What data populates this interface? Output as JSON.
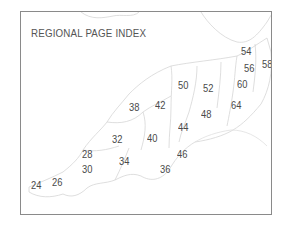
{
  "map": {
    "title": "REGIONAL PAGE INDEX",
    "pages": [
      {
        "label": "24",
        "x": 10,
        "y": 168
      },
      {
        "label": "26",
        "x": 31,
        "y": 165
      },
      {
        "label": "28",
        "x": 61,
        "y": 137
      },
      {
        "label": "30",
        "x": 61,
        "y": 152
      },
      {
        "label": "32",
        "x": 91,
        "y": 122
      },
      {
        "label": "34",
        "x": 98,
        "y": 144
      },
      {
        "label": "36",
        "x": 139,
        "y": 152
      },
      {
        "label": "38",
        "x": 108,
        "y": 90
      },
      {
        "label": "40",
        "x": 126,
        "y": 121
      },
      {
        "label": "42",
        "x": 134,
        "y": 88
      },
      {
        "label": "44",
        "x": 157,
        "y": 110
      },
      {
        "label": "46",
        "x": 156,
        "y": 137
      },
      {
        "label": "48",
        "x": 180,
        "y": 97
      },
      {
        "label": "50",
        "x": 157,
        "y": 68
      },
      {
        "label": "52",
        "x": 182,
        "y": 71
      },
      {
        "label": "54",
        "x": 220,
        "y": 34
      },
      {
        "label": "56",
        "x": 223,
        "y": 51
      },
      {
        "label": "58",
        "x": 241,
        "y": 47
      },
      {
        "label": "60",
        "x": 216,
        "y": 67
      },
      {
        "label": "64",
        "x": 210,
        "y": 88
      }
    ]
  }
}
